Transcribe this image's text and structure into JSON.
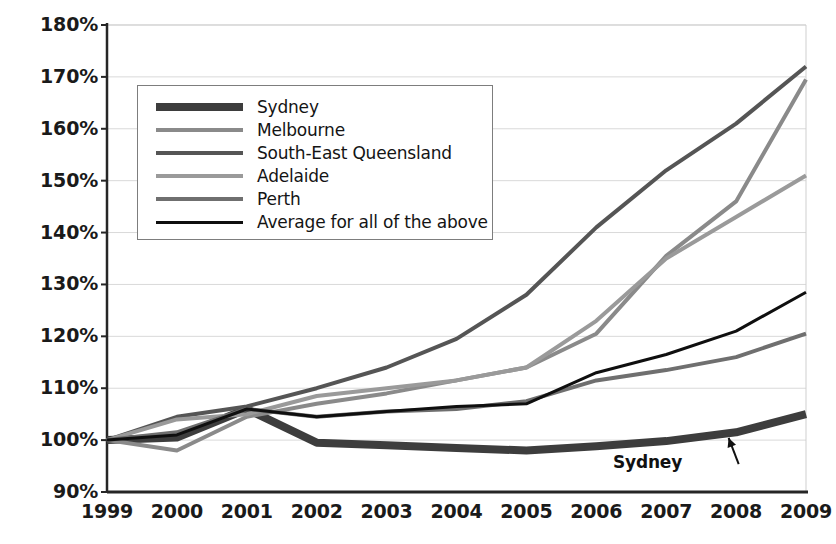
{
  "chart_data": {
    "type": "line",
    "title": "",
    "xlabel": "",
    "ylabel": "",
    "x": [
      1999,
      2000,
      2001,
      2002,
      2003,
      2004,
      2005,
      2006,
      2007,
      2008,
      2009
    ],
    "xtick_labels": [
      "1999",
      "2000",
      "2001",
      "2002",
      "2003",
      "2004",
      "2005",
      "2006",
      "2007",
      "2008",
      "2009"
    ],
    "ytick_labels": [
      "180%",
      "170%",
      "160%",
      "150%",
      "140%",
      "130%",
      "120%",
      "110%",
      "100%",
      "90%"
    ],
    "ytick_values": [
      180,
      170,
      160,
      150,
      140,
      130,
      120,
      110,
      100,
      90
    ],
    "ylim": [
      90,
      180
    ],
    "xlim": [
      1999,
      2009
    ],
    "grid": true,
    "legend_position": "upper-left-inside",
    "series": [
      {
        "name": "Sydney",
        "color": "#3d3d3d",
        "width": 8,
        "values": [
          100,
          100.5,
          106,
          99.5,
          99,
          98.5,
          98,
          98.8,
          99.8,
          101.5,
          105
        ]
      },
      {
        "name": "Melbourne",
        "color": "#8a8a8a",
        "width": 4,
        "values": [
          100,
          98,
          104.5,
          107,
          109,
          111.5,
          114,
          120.5,
          135.5,
          146,
          169.5
        ]
      },
      {
        "name": "South-East Queensland",
        "color": "#555555",
        "width": 4,
        "values": [
          100,
          104.5,
          106.5,
          110,
          114,
          119.5,
          128,
          141,
          152,
          161,
          172
        ]
      },
      {
        "name": "Adelaide",
        "color": "#9a9a9a",
        "width": 4,
        "values": [
          100,
          104,
          105,
          108.5,
          110,
          111.5,
          114,
          123,
          135,
          143,
          151
        ]
      },
      {
        "name": "Perth",
        "color": "#6f6f6f",
        "width": 4,
        "values": [
          100,
          101.5,
          106,
          104.5,
          105.5,
          106,
          107.5,
          111.5,
          113.5,
          116,
          120.5
        ]
      },
      {
        "name": "Average for all of the above",
        "color": "#0f0f0f",
        "width": 3,
        "values": [
          100,
          101,
          106,
          104.5,
          105.5,
          106.5,
          107,
          113,
          116.5,
          121,
          128.5
        ]
      }
    ],
    "annotations": [
      {
        "text": "Sydney",
        "x": 2007.15,
        "y": 94.2,
        "arrow_to_x": 2007.75,
        "arrow_to_y": 100.8
      }
    ]
  },
  "legend": {
    "items": [
      {
        "label": "Sydney"
      },
      {
        "label": "Melbourne"
      },
      {
        "label": "South-East Queensland"
      },
      {
        "label": "Adelaide"
      },
      {
        "label": "Perth"
      },
      {
        "label": "Average for all of the above"
      }
    ]
  },
  "top_title": {
    "text": ""
  }
}
